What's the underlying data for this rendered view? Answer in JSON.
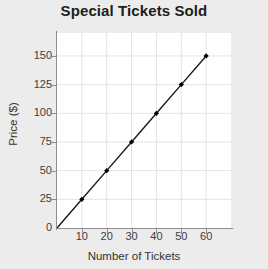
{
  "chart_data": {
    "type": "line",
    "title": "Special Tickets Sold",
    "xlabel": "Number of Tickets",
    "ylabel": "Price ($)",
    "x": [
      0,
      10,
      20,
      30,
      40,
      50,
      60
    ],
    "values": [
      0,
      25,
      50,
      75,
      100,
      125,
      150
    ],
    "markers_x": [
      10,
      20,
      30,
      40,
      50,
      60
    ],
    "markers_y": [
      25,
      50,
      75,
      100,
      125,
      150
    ],
    "xlim": [
      0,
      70
    ],
    "ylim": [
      0,
      170
    ],
    "xticks": [
      0,
      10,
      20,
      30,
      40,
      50,
      60
    ],
    "xtick_labels": [
      "0",
      "10",
      "20",
      "30",
      "40",
      "50",
      "60"
    ],
    "yticks": [
      0,
      25,
      50,
      75,
      100,
      125,
      150
    ],
    "ytick_labels": [
      "0",
      "25",
      "50",
      "75",
      "100",
      "125",
      "150"
    ],
    "grid": true,
    "legend": null,
    "series_name": "Price",
    "line_color": "#1a1a1a",
    "marker_color": "#000000",
    "grid_color": "#e3e3e3",
    "plot_background": "#ffffff",
    "figure_background": "#ececec",
    "title_color": "#1d1d1d",
    "axis_color": "#8d8d8d"
  }
}
